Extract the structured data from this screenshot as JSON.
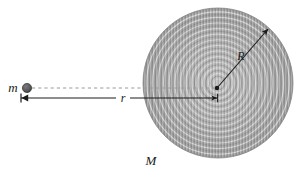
{
  "figure": {
    "domain": "diagram",
    "background_color": "#ffffff",
    "width": 307,
    "height": 178
  },
  "labels": {
    "small_mass": "m",
    "large_mass": "M",
    "radius": "R",
    "distance": "r"
  },
  "colors": {
    "ink": "#1a1a1a",
    "point_mass_fill": "#595959",
    "point_mass_stroke": "#2b2b2b",
    "disk_light": "#d4d4d4",
    "disk_mid": "#a8a8a8",
    "disk_dark": "#7d7d7d",
    "dashed_line": "#9a9a9a",
    "arrow_line": "#1a1a1a"
  },
  "geometry": {
    "disk": {
      "center_x": 218,
      "center_y": 83,
      "radius": 75,
      "ring_count": 26
    },
    "point_mass": {
      "center_x": 27,
      "center_y": 88,
      "radius": 4.5
    },
    "dashed_line": {
      "x1": 32,
      "y1": 88,
      "x2": 216,
      "y2": 88
    },
    "distance_arrow": {
      "x1": 21,
      "y1": 98,
      "x2": 217,
      "y2": 98,
      "label_x": 123,
      "label_y": 102
    },
    "radius_arrow": {
      "x1": 217,
      "y1": 88,
      "x2": 268,
      "y2": 29,
      "label_x": 241,
      "label_y": 60
    },
    "label_positions": {
      "small_mass_x": 13,
      "small_mass_y": 92,
      "large_mass_x": 145,
      "large_mass_y": 165
    }
  }
}
